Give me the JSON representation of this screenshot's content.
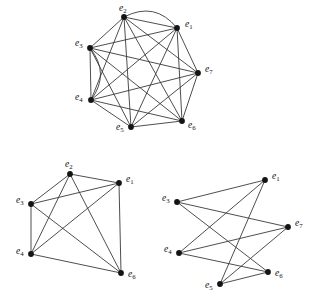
{
  "figure": {
    "title": "",
    "width": 323,
    "height": 306,
    "background": "#ffffff",
    "edge_color": "#3a3a3a",
    "vertex_color": "#141414",
    "label_color": "#101010"
  },
  "graphs": [
    {
      "id": "graph-top",
      "name": "top-graph",
      "caption": "",
      "vertices": [
        {
          "id": "e1",
          "label": "e",
          "subscript": "1",
          "x": 177,
          "y": 28,
          "lx": 185,
          "ly": 27
        },
        {
          "id": "e2",
          "label": "e",
          "subscript": "2",
          "x": 124,
          "y": 17,
          "lx": 119,
          "ly": 11
        },
        {
          "id": "e3",
          "label": "e",
          "subscript": "3",
          "x": 90,
          "y": 48,
          "lx": 75,
          "ly": 46
        },
        {
          "id": "e4",
          "label": "e",
          "subscript": "4",
          "x": 91,
          "y": 100,
          "lx": 75,
          "ly": 100
        },
        {
          "id": "e5",
          "label": "e",
          "subscript": "5",
          "x": 131,
          "y": 127,
          "lx": 116,
          "ly": 130
        },
        {
          "id": "e6",
          "label": "e",
          "subscript": "6",
          "x": 182,
          "y": 121,
          "lx": 188,
          "ly": 128
        },
        {
          "id": "e7",
          "label": "e",
          "subscript": "7",
          "x": 198,
          "y": 73,
          "lx": 205,
          "ly": 72
        }
      ],
      "edges": [
        {
          "from": "e1",
          "to": "e2",
          "curve": 0
        },
        {
          "from": "e1",
          "to": "e2",
          "curve": 22
        },
        {
          "from": "e1",
          "to": "e3",
          "curve": 0
        },
        {
          "from": "e1",
          "to": "e4",
          "curve": 0
        },
        {
          "from": "e1",
          "to": "e5",
          "curve": 0
        },
        {
          "from": "e1",
          "to": "e6",
          "curve": 0
        },
        {
          "from": "e1",
          "to": "e7",
          "curve": 0
        },
        {
          "from": "e2",
          "to": "e3",
          "curve": 0
        },
        {
          "from": "e2",
          "to": "e4",
          "curve": 0
        },
        {
          "from": "e2",
          "to": "e5",
          "curve": 0
        },
        {
          "from": "e2",
          "to": "e6",
          "curve": 0
        },
        {
          "from": "e2",
          "to": "e7",
          "curve": 0
        },
        {
          "from": "e3",
          "to": "e4",
          "curve": 0
        },
        {
          "from": "e3",
          "to": "e4",
          "curve": -20
        },
        {
          "from": "e3",
          "to": "e5",
          "curve": 0
        },
        {
          "from": "e3",
          "to": "e6",
          "curve": 0
        },
        {
          "from": "e3",
          "to": "e7",
          "curve": 0
        },
        {
          "from": "e4",
          "to": "e5",
          "curve": 0
        },
        {
          "from": "e4",
          "to": "e6",
          "curve": 0
        },
        {
          "from": "e4",
          "to": "e7",
          "curve": 0
        },
        {
          "from": "e5",
          "to": "e6",
          "curve": 0
        },
        {
          "from": "e5",
          "to": "e7",
          "curve": 0
        },
        {
          "from": "e6",
          "to": "e7",
          "curve": 0
        }
      ]
    },
    {
      "id": "graph-bottom-left",
      "name": "bottom-left-graph",
      "caption": "",
      "vertices": [
        {
          "id": "e1",
          "label": "e",
          "subscript": "1",
          "x": 119,
          "y": 183,
          "lx": 126,
          "ly": 182
        },
        {
          "id": "e2",
          "label": "e",
          "subscript": "2",
          "x": 70,
          "y": 174,
          "lx": 65,
          "ly": 167
        },
        {
          "id": "e3",
          "label": "e",
          "subscript": "3",
          "x": 31,
          "y": 204,
          "lx": 16,
          "ly": 203
        },
        {
          "id": "e4",
          "label": "e",
          "subscript": "4",
          "x": 31,
          "y": 254,
          "lx": 16,
          "ly": 254
        },
        {
          "id": "e6",
          "label": "e",
          "subscript": "6",
          "x": 121,
          "y": 273,
          "lx": 128,
          "ly": 277
        }
      ],
      "edges": [
        {
          "from": "e2",
          "to": "e1",
          "curve": 0
        },
        {
          "from": "e2",
          "to": "e3",
          "curve": 0
        },
        {
          "from": "e2",
          "to": "e4",
          "curve": 0
        },
        {
          "from": "e2",
          "to": "e6",
          "curve": 0
        },
        {
          "from": "e3",
          "to": "e1",
          "curve": 0
        },
        {
          "from": "e3",
          "to": "e4",
          "curve": 0
        },
        {
          "from": "e3",
          "to": "e6",
          "curve": 0
        },
        {
          "from": "e4",
          "to": "e1",
          "curve": 0
        },
        {
          "from": "e4",
          "to": "e6",
          "curve": 0
        },
        {
          "from": "e1",
          "to": "e6",
          "curve": 0
        }
      ]
    },
    {
      "id": "graph-bottom-right",
      "name": "bottom-right-graph",
      "caption": "",
      "vertices": [
        {
          "id": "e1",
          "label": "e",
          "subscript": "1",
          "x": 265,
          "y": 180,
          "lx": 272,
          "ly": 179
        },
        {
          "id": "e3",
          "label": "e",
          "subscript": "3",
          "x": 177,
          "y": 202,
          "lx": 162,
          "ly": 201
        },
        {
          "id": "e4",
          "label": "e",
          "subscript": "4",
          "x": 179,
          "y": 253,
          "lx": 164,
          "ly": 252
        },
        {
          "id": "e5",
          "label": "e",
          "subscript": "5",
          "x": 220,
          "y": 284,
          "lx": 205,
          "ly": 288
        },
        {
          "id": "e6",
          "label": "e",
          "subscript": "6",
          "x": 268,
          "y": 272,
          "lx": 275,
          "ly": 276
        },
        {
          "id": "e7",
          "label": "e",
          "subscript": "7",
          "x": 288,
          "y": 227,
          "lx": 295,
          "ly": 226
        }
      ],
      "edges": [
        {
          "from": "e3",
          "to": "e1",
          "curve": 0
        },
        {
          "from": "e3",
          "to": "e7",
          "curve": 0
        },
        {
          "from": "e3",
          "to": "e6",
          "curve": 0
        },
        {
          "from": "e4",
          "to": "e1",
          "curve": 0
        },
        {
          "from": "e4",
          "to": "e7",
          "curve": 0
        },
        {
          "from": "e4",
          "to": "e6",
          "curve": 0
        },
        {
          "from": "e5",
          "to": "e1",
          "curve": 0
        },
        {
          "from": "e5",
          "to": "e7",
          "curve": 0
        },
        {
          "from": "e5",
          "to": "e6",
          "curve": 0
        }
      ]
    }
  ]
}
